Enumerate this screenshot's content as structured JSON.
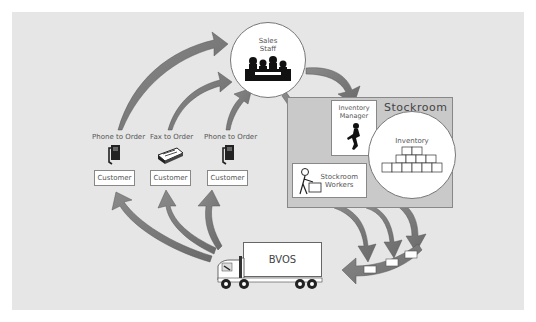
{
  "diagram": {
    "sales": {
      "label_line1": "Sales",
      "label_line2": "Staff"
    },
    "stockroom": {
      "title": "Stockroom",
      "manager": {
        "line1": "Inventory",
        "line2": "Manager"
      },
      "inventory": "Inventory",
      "workers": {
        "line1": "Stockroom",
        "line2": "Workers"
      }
    },
    "channels": [
      {
        "label": "Phone to Order",
        "icon": "phone-icon",
        "customer": "Customer"
      },
      {
        "label": "Fax to Order",
        "icon": "fax-icon",
        "customer": "Customer"
      },
      {
        "label": "Phone to Order",
        "icon": "phone-icon",
        "customer": "Customer"
      }
    ],
    "truck": {
      "label": "BVOS"
    },
    "colors": {
      "background": "#e6e6e6",
      "stockroom_fill": "#c9c9c9",
      "arrow": "#777777",
      "box_border": "#888888"
    }
  }
}
